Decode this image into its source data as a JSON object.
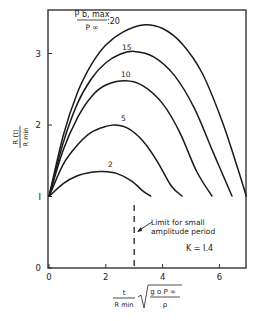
{
  "chart_data": {
    "type": "line",
    "title": "",
    "xlabel": "t / R_min · sqrt(g_o P_∞ / ρ)",
    "ylabel": "R(t) / R_min",
    "xlim": [
      0,
      6.95
    ],
    "ylim": [
      0,
      3.6
    ],
    "x_ticks": [
      0,
      2,
      4,
      6
    ],
    "y_ticks": [
      0,
      1,
      2,
      3
    ],
    "grid": false,
    "legend_title": "P_b,max / P_∞",
    "series": [
      {
        "name": "2",
        "label": "2",
        "x": [
          0,
          0.5,
          1.0,
          1.5,
          1.9,
          2.4,
          2.9,
          3.3,
          3.6
        ],
        "y": [
          1.0,
          1.18,
          1.29,
          1.34,
          1.35,
          1.32,
          1.22,
          1.08,
          1.0
        ]
      },
      {
        "name": "5",
        "label": "5",
        "x": [
          0,
          0.5,
          1.0,
          1.5,
          2.0,
          2.35,
          2.8,
          3.3,
          3.8,
          4.3,
          4.7
        ],
        "y": [
          1.0,
          1.45,
          1.72,
          1.9,
          1.98,
          2.0,
          1.95,
          1.78,
          1.5,
          1.15,
          1.0
        ]
      },
      {
        "name": "10",
        "label": "10",
        "x": [
          0,
          0.5,
          1.0,
          1.5,
          2.0,
          2.7,
          3.3,
          4.0,
          4.6,
          5.2,
          5.75
        ],
        "y": [
          1.0,
          1.65,
          2.1,
          2.4,
          2.56,
          2.62,
          2.55,
          2.3,
          1.9,
          1.35,
          1.0
        ]
      },
      {
        "name": "15",
        "label": "15",
        "x": [
          0,
          0.5,
          1.0,
          1.5,
          2.0,
          2.5,
          3.0,
          3.7,
          4.4,
          5.1,
          5.8,
          6.45
        ],
        "y": [
          1.0,
          1.75,
          2.3,
          2.65,
          2.87,
          2.99,
          3.03,
          2.95,
          2.7,
          2.25,
          1.6,
          1.0
        ]
      },
      {
        "name": "20",
        "label": "20",
        "x": [
          0,
          0.5,
          1.0,
          1.5,
          2.0,
          2.6,
          3.3,
          4.0,
          4.7,
          5.4,
          6.1,
          6.6,
          6.95
        ],
        "y": [
          1.0,
          1.85,
          2.45,
          2.85,
          3.12,
          3.3,
          3.4,
          3.35,
          3.13,
          2.72,
          2.05,
          1.45,
          1.0
        ]
      }
    ],
    "annotations": [
      {
        "type": "vline",
        "x": 3.0,
        "style": "dashed",
        "text": "Limit for small amplitude period"
      },
      {
        "type": "text",
        "text": "K = 1.4"
      }
    ]
  },
  "labels": {
    "ylabel_num": "R (t)",
    "ylabel_den": "R min",
    "legend_num": "P b, max",
    "legend_den": "P ∞",
    "legend_first_value": ":20",
    "limit_line1": "Limit for small",
    "limit_line2": "amplitude period",
    "k_label": "K = I.4",
    "xlabel_num": "t",
    "xlabel_den": "R min",
    "xlabel_sqrt_num": "g o P ∞",
    "xlabel_sqrt_den": "ρ"
  }
}
